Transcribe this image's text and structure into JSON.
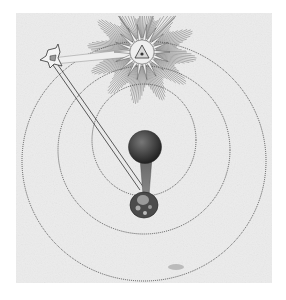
{
  "image": {
    "subject": "Engraving of cosmological diagram: radiant sun with eye in triangle, star emitting ray beam to earth, dark moon sphere, concentric dotted orbits",
    "elements": [
      "sun-with-eye-triangle",
      "star",
      "light-beam",
      "moon-sphere",
      "earth",
      "orbit-circles"
    ]
  },
  "colors": {
    "background": "#ffffff",
    "paper": "#ededed",
    "ink": "#3a3a3a",
    "moon": "#4a4a4a"
  }
}
